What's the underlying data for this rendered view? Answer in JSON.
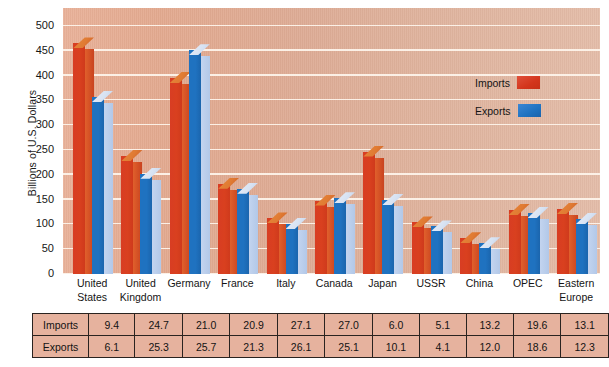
{
  "chart_data": {
    "type": "bar",
    "title": "",
    "subtitle": "",
    "xlabel": "",
    "ylabel": "Billions of U.S. Dollars",
    "ylim": [
      0,
      500
    ],
    "yticks": [
      0,
      50,
      100,
      150,
      200,
      250,
      300,
      350,
      400,
      450,
      500
    ],
    "grid": true,
    "legend_position": "right-inside",
    "categories": [
      "United States",
      "United Kingdom",
      "Germany",
      "France",
      "Italy",
      "Canada",
      "Japan",
      "USSR",
      "China",
      "OPEC",
      "Eastern Europe"
    ],
    "series": [
      {
        "name": "Imports",
        "color": "#d3351c",
        "values": [
          465,
          238,
          395,
          182,
          112,
          148,
          247,
          104,
          72,
          129,
          131
        ]
      },
      {
        "name": "Exports",
        "color": "#1f72c0",
        "values": [
          357,
          202,
          451,
          172,
          101,
          153,
          149,
          96,
          62,
          123,
          111
        ]
      }
    ],
    "table": {
      "row_labels": [
        "Imports",
        "Exports"
      ],
      "rows": [
        [
          "9.4",
          "24.7",
          "21.0",
          "20.9",
          "27.1",
          "27.0",
          "6.0",
          "5.1",
          "13.2",
          "19.6",
          "13.1"
        ],
        [
          "6.1",
          "25.3",
          "25.7",
          "21.3",
          "26.1",
          "25.1",
          "10.1",
          "4.1",
          "12.0",
          "18.6",
          "12.3"
        ]
      ]
    }
  },
  "axis": {
    "ylabel": "Billions of U.S. Dollars",
    "yticks": [
      "500",
      "450",
      "400",
      "350",
      "300",
      "250",
      "200",
      "150",
      "100",
      "50",
      "0"
    ]
  },
  "legend": {
    "items": [
      {
        "label": "Imports",
        "color": "#d3351c"
      },
      {
        "label": "Exports",
        "color": "#1f72c0"
      }
    ]
  },
  "colors": {
    "plot_background": "#e0ab93",
    "gridline": "#fdf3ea",
    "imports": "#d3351c",
    "exports": "#1f72c0",
    "table_cell": "#e6b29e",
    "table_border": "#2a2320"
  }
}
